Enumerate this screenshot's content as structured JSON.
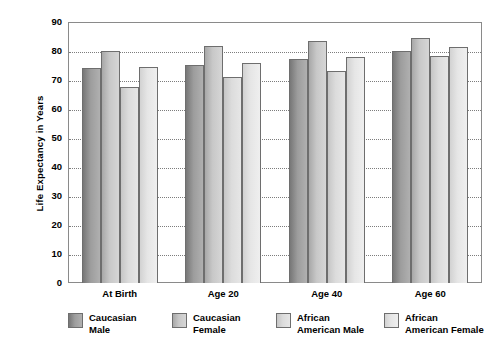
{
  "chart_data": {
    "type": "bar",
    "title": "",
    "xlabel": "",
    "ylabel": "Life Expectancy in Years",
    "ylim": [
      0,
      90
    ],
    "ytick_step": 10,
    "yticks": [
      "90",
      "80",
      "70",
      "60",
      "50",
      "40",
      "30",
      "20",
      "10",
      "0"
    ],
    "grid": true,
    "grid_axis": "y",
    "legend_position": "bottom",
    "categories": [
      "At Birth",
      "Age 20",
      "Age 40",
      "Age 60"
    ],
    "series": [
      {
        "name": "Caucasian\nMale",
        "legend_label_line1": "Caucasian",
        "legend_label_line2": "Male",
        "color": "#9d9d9d",
        "values": [
          74.2,
          75.3,
          77.2,
          80.0
        ]
      },
      {
        "name": "Caucasian\nFemale",
        "legend_label_line1": "Caucasian",
        "legend_label_line2": "Female",
        "color": "#c8c8c8",
        "values": [
          80.0,
          81.9,
          83.4,
          84.5
        ]
      },
      {
        "name": "African\nAmerican Male",
        "legend_label_line1": "African",
        "legend_label_line2": "American Male",
        "color": "#dcdcdc",
        "values": [
          67.5,
          71.0,
          73.0,
          78.2
        ]
      },
      {
        "name": "African\nAmerican Female",
        "legend_label_line1": "African",
        "legend_label_line2": "American Female",
        "color": "#e6e6e6",
        "values": [
          74.4,
          76.0,
          77.8,
          81.5
        ]
      }
    ]
  },
  "axis": {
    "y_title": "Life Expectancy in Years"
  },
  "legend": {
    "items": [
      {
        "label": "Caucasian\nMale"
      },
      {
        "label": "Caucasian\nFemale"
      },
      {
        "label": "African\nAmerican Male"
      },
      {
        "label": "African\nAmerican Female"
      }
    ]
  }
}
